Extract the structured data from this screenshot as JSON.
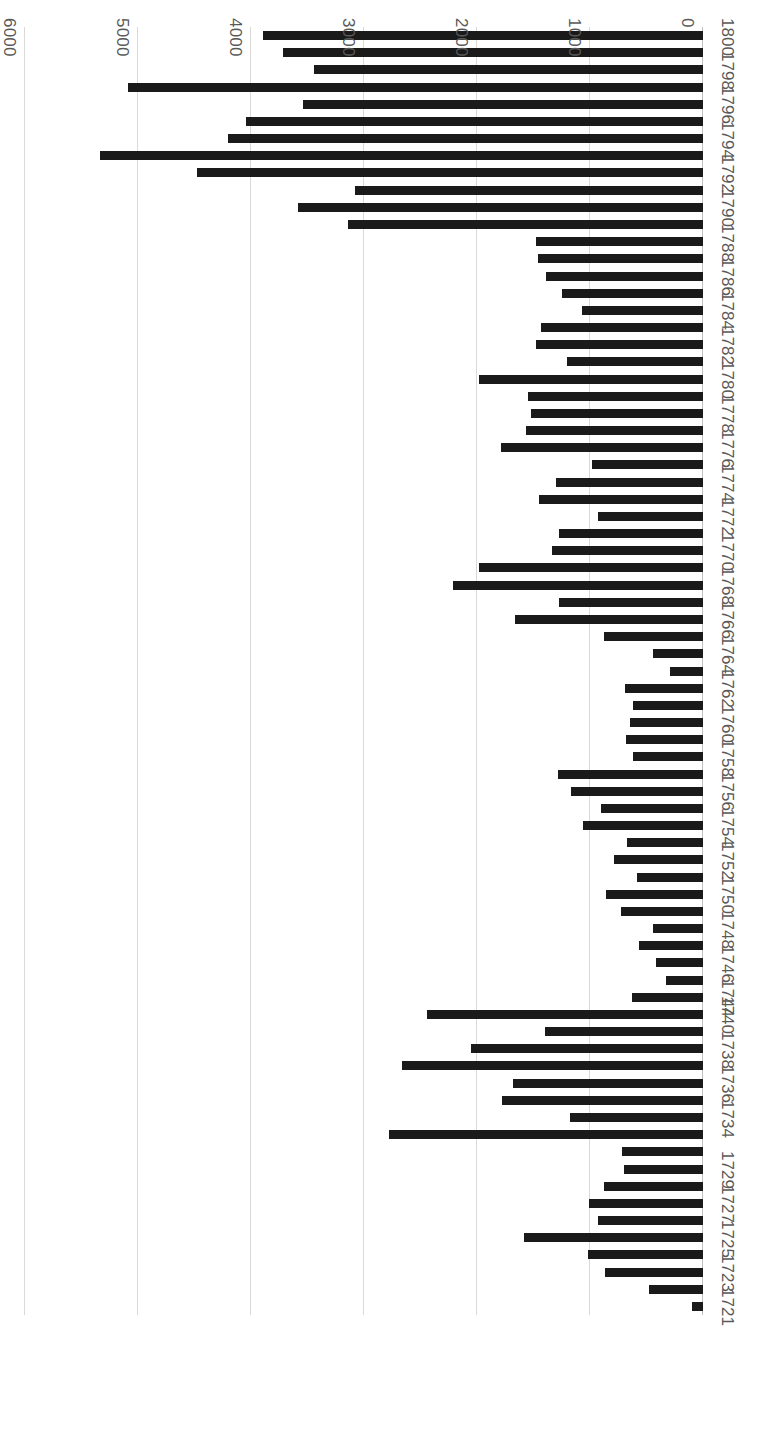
{
  "figure": {
    "orientation": "rotated-180",
    "plot_background": "#ffffff",
    "bar_color": "#1a1a1a",
    "gridline_color": "#d9d9d9",
    "tick_label_color": "#595959"
  },
  "chart_data": {
    "type": "bar",
    "orientation": "horizontal",
    "title": "",
    "subtitle": "",
    "xlabel": "",
    "ylabel": "",
    "xlim": [
      0,
      6000
    ],
    "grid": "vertical gridlines at every 1000 units",
    "legend": null,
    "legend_position": "none",
    "value_axis_ticks": [
      "0",
      "1000",
      "2000",
      "3000",
      "4000",
      "5000",
      "6000"
    ],
    "value_axis_tick_values": [
      0,
      1000,
      2000,
      3000,
      4000,
      5000,
      6000
    ],
    "category_axis_labels_shown": [
      "1721",
      "1723",
      "1725",
      "1727",
      "1729",
      "1734",
      "1736",
      "1738",
      "1740",
      "1744",
      "1746",
      "1748",
      "1750",
      "1752",
      "1754",
      "1756",
      "1758",
      "1760",
      "1762",
      "1764",
      "1766",
      "1768",
      "1770",
      "1772",
      "1774",
      "1776",
      "1778",
      "1780",
      "1782",
      "1784",
      "1786",
      "1788",
      "1790",
      "1792",
      "1794",
      "1796",
      "1798",
      "1800"
    ],
    "categories": [
      "1721",
      "1722",
      "1723",
      "1724",
      "1725",
      "1726",
      "1727",
      "1728",
      "1729",
      "1730",
      "1733",
      "1734",
      "1735",
      "1736",
      "1737",
      "1738",
      "1739",
      "1740",
      "1744",
      "1745",
      "1746",
      "1747",
      "1748",
      "1749",
      "1750",
      "1751",
      "1752",
      "1753",
      "1754",
      "1755",
      "1756",
      "1757",
      "1758",
      "1759",
      "1760",
      "1761",
      "1762",
      "1763",
      "1764",
      "1765",
      "1766",
      "1767",
      "1768",
      "1769",
      "1770",
      "1771",
      "1772",
      "1773",
      "1774",
      "1775",
      "1776",
      "1777",
      "1778",
      "1779",
      "1780",
      "1781",
      "1782",
      "1783",
      "1784",
      "1785",
      "1786",
      "1787",
      "1788",
      "1789",
      "1790",
      "1791",
      "1792",
      "1793",
      "1794",
      "1795",
      "1796",
      "1797",
      "1798",
      "1799",
      "1800"
    ],
    "values": [
      100,
      480,
      870,
      1020,
      1580,
      930,
      1010,
      880,
      700,
      720,
      2780,
      1180,
      1780,
      1680,
      2660,
      2050,
      1400,
      2440,
      630,
      330,
      420,
      570,
      440,
      730,
      860,
      580,
      790,
      670,
      1060,
      900,
      1170,
      1280,
      620,
      680,
      650,
      620,
      690,
      290,
      440,
      880,
      1660,
      1270,
      2210,
      1980,
      1340,
      1270,
      930,
      1450,
      1300,
      980,
      1790,
      1570,
      1520,
      1550,
      1980,
      1200,
      1480,
      1430,
      1070,
      1250,
      1390,
      1460,
      1480,
      3140,
      3580,
      3080,
      4480,
      5340,
      4200,
      4040,
      3540,
      5090,
      3440,
      3720,
      3890
    ]
  }
}
